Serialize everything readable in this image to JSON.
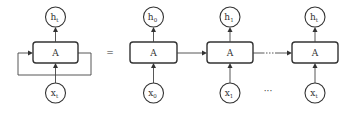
{
  "diagram": {
    "type": "rnn-unrolled",
    "colors": {
      "stroke": "#333333",
      "background": "#ffffff"
    },
    "folded": {
      "cell": {
        "label": "A"
      },
      "output": {
        "main": "h",
        "sub": "t"
      },
      "input": {
        "main": "x",
        "sub": "t"
      }
    },
    "equals_sign": "=",
    "unrolled": [
      {
        "cell": {
          "label": "A"
        },
        "output": {
          "main": "h",
          "sub": "0"
        },
        "input": {
          "main": "x",
          "sub": "0"
        }
      },
      {
        "cell": {
          "label": "A"
        },
        "output": {
          "main": "h",
          "sub": "1"
        },
        "input": {
          "main": "x",
          "sub": "1"
        }
      },
      {
        "cell": {
          "label": "A"
        },
        "output": {
          "main": "h",
          "sub": "t"
        },
        "input": {
          "main": "x",
          "sub": "t"
        }
      }
    ],
    "input_ellipsis": "···",
    "edge_ellipsis": "···"
  }
}
